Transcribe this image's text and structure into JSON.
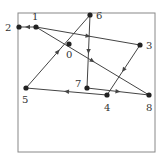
{
  "diagram": {
    "type": "directed-graph",
    "frame": {
      "x": 18,
      "y": 13,
      "width": 137,
      "height": 139,
      "stroke": "#888888"
    },
    "edge_color": "#444444",
    "node_color": "#222222",
    "nodes": [
      {
        "id": "0",
        "label": "0",
        "x": 69,
        "y": 44,
        "lx": 66,
        "ly": 58
      },
      {
        "id": "1",
        "label": "1",
        "x": 36,
        "y": 27,
        "lx": 32,
        "ly": 20
      },
      {
        "id": "2",
        "label": "2",
        "x": 19,
        "y": 27,
        "lx": 5,
        "ly": 31
      },
      {
        "id": "3",
        "label": "3",
        "x": 140,
        "y": 45,
        "lx": 146,
        "ly": 49
      },
      {
        "id": "4",
        "label": "4",
        "x": 107,
        "y": 95,
        "lx": 104,
        "ly": 111
      },
      {
        "id": "5",
        "label": "5",
        "x": 26,
        "y": 88,
        "lx": 22,
        "ly": 103
      },
      {
        "id": "6",
        "label": "6",
        "x": 90,
        "y": 15,
        "lx": 96,
        "ly": 19
      },
      {
        "id": "7",
        "label": "7",
        "x": 87,
        "y": 88,
        "lx": 75,
        "ly": 87
      },
      {
        "id": "8",
        "label": "8",
        "x": 149,
        "y": 95,
        "lx": 146,
        "ly": 111
      }
    ],
    "edges": [
      {
        "from": "1",
        "to": "2"
      },
      {
        "from": "1",
        "to": "3"
      },
      {
        "from": "1",
        "to": "8"
      },
      {
        "from": "3",
        "to": "4"
      },
      {
        "from": "4",
        "to": "5"
      },
      {
        "from": "5",
        "to": "6"
      },
      {
        "from": "6",
        "to": "7"
      },
      {
        "from": "7",
        "to": "8"
      }
    ]
  }
}
